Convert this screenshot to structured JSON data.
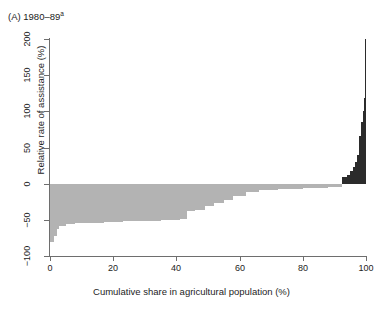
{
  "panel": {
    "label": "(A) 1980–89",
    "footnote_marker": "a"
  },
  "colors": {
    "negative_bar": "#b3b3b3",
    "positive_bar": "#2b2b2b",
    "axis": "#6e6e6e",
    "text": "#1d1d1d",
    "background": "#ffffff"
  },
  "chart_data": {
    "type": "bar",
    "xlabel": "Cumulative share in agricultural population (%)",
    "ylabel": "Relative rate of assistance (%)",
    "xlim": [
      0,
      100
    ],
    "ylim": [
      -100,
      200
    ],
    "xticks": [
      0,
      20,
      40,
      60,
      80,
      100
    ],
    "yticks": [
      -100,
      -50,
      0,
      50,
      100,
      150,
      200
    ],
    "grid": false,
    "legend": "none",
    "orientation": "vertical",
    "bars": [
      {
        "x_start": 0.0,
        "x_end": 1.2,
        "value": -80
      },
      {
        "x_start": 1.2,
        "x_end": 2.1,
        "value": -72
      },
      {
        "x_start": 2.1,
        "x_end": 3.0,
        "value": -62
      },
      {
        "x_start": 3.0,
        "x_end": 5.0,
        "value": -58
      },
      {
        "x_start": 5.0,
        "x_end": 8.0,
        "value": -56
      },
      {
        "x_start": 8.0,
        "x_end": 12.0,
        "value": -55
      },
      {
        "x_start": 12.0,
        "x_end": 17.0,
        "value": -54
      },
      {
        "x_start": 17.0,
        "x_end": 23.0,
        "value": -53
      },
      {
        "x_start": 23.0,
        "x_end": 29.0,
        "value": -52
      },
      {
        "x_start": 29.0,
        "x_end": 35.0,
        "value": -51
      },
      {
        "x_start": 35.0,
        "x_end": 41.0,
        "value": -50
      },
      {
        "x_start": 41.0,
        "x_end": 43.5,
        "value": -49
      },
      {
        "x_start": 43.5,
        "x_end": 46.0,
        "value": -38
      },
      {
        "x_start": 46.0,
        "x_end": 49.0,
        "value": -36
      },
      {
        "x_start": 49.0,
        "x_end": 52.0,
        "value": -31
      },
      {
        "x_start": 52.0,
        "x_end": 55.0,
        "value": -27
      },
      {
        "x_start": 55.0,
        "x_end": 58.0,
        "value": -22
      },
      {
        "x_start": 58.0,
        "x_end": 62.0,
        "value": -17
      },
      {
        "x_start": 62.0,
        "x_end": 66.0,
        "value": -12
      },
      {
        "x_start": 66.0,
        "x_end": 72.0,
        "value": -9
      },
      {
        "x_start": 72.0,
        "x_end": 80.0,
        "value": -7
      },
      {
        "x_start": 80.0,
        "x_end": 88.0,
        "value": -6
      },
      {
        "x_start": 88.0,
        "x_end": 92.5,
        "value": -4
      },
      {
        "x_start": 92.5,
        "x_end": 94.0,
        "value": 9
      },
      {
        "x_start": 94.0,
        "x_end": 95.0,
        "value": 12
      },
      {
        "x_start": 95.0,
        "x_end": 95.8,
        "value": 17
      },
      {
        "x_start": 95.8,
        "x_end": 96.6,
        "value": 23
      },
      {
        "x_start": 96.6,
        "x_end": 97.3,
        "value": 30
      },
      {
        "x_start": 97.3,
        "x_end": 97.9,
        "value": 40
      },
      {
        "x_start": 97.9,
        "x_end": 98.4,
        "value": 66
      },
      {
        "x_start": 98.4,
        "x_end": 98.9,
        "value": 85
      },
      {
        "x_start": 98.9,
        "x_end": 99.3,
        "value": 100
      },
      {
        "x_start": 99.3,
        "x_end": 99.6,
        "value": 118
      },
      {
        "x_start": 99.6,
        "x_end": 99.8,
        "value": 128
      },
      {
        "x_start": 99.8,
        "x_end": 100.0,
        "value": 200
      }
    ]
  }
}
